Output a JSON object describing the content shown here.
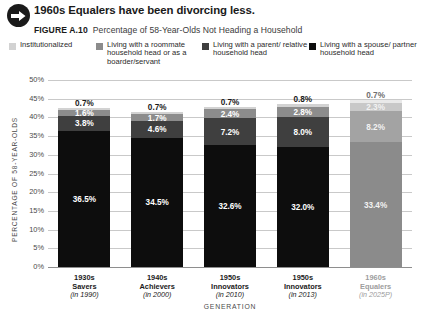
{
  "header": {
    "icon": "arrow-right-circle-icon",
    "title": "1960s Equalers have been divorcing less.",
    "figure_number": "FIGURE A.10",
    "figure_description": "Percentage of 58-Year-Olds Not Heading a Household"
  },
  "legend": {
    "items": [
      {
        "label": "Institutionalized",
        "color": "#d2d2d2"
      },
      {
        "label": "Living with a roommate household head or as a boarder/servant",
        "color": "#8c8c8c"
      },
      {
        "label": "Living with a parent/ relative household head",
        "color": "#3f3f3f"
      },
      {
        "label": "Living with a spouse/ partner household head",
        "color": "#0d0d0d"
      }
    ]
  },
  "chart_data": {
    "type": "bar",
    "stacked": true,
    "title": "Percentage of 58-Year-Olds Not Heading a Household",
    "xlabel": "GENERATION",
    "ylabel": "PERCENTAGE OF 58-YEAR-OLDS",
    "ylim": [
      0,
      50
    ],
    "ytick_labels": [
      "50%",
      "45%",
      "40%",
      "35%",
      "30%",
      "25%",
      "20%",
      "15%",
      "10%",
      "5%",
      "0%"
    ],
    "ytick_values": [
      50,
      45,
      40,
      35,
      30,
      25,
      20,
      15,
      10,
      5,
      0
    ],
    "grid": true,
    "legend_position": "top",
    "categories": [
      {
        "generation": "1930s",
        "cohort": "Savers",
        "year": "(in 1990)",
        "projected": false
      },
      {
        "generation": "1940s",
        "cohort": "Achievers",
        "year": "(in 2000)",
        "projected": false
      },
      {
        "generation": "1950s",
        "cohort": "Innovators",
        "year": "(in 2010)",
        "projected": false
      },
      {
        "generation": "1950s",
        "cohort": "Innovators",
        "year": "(in 2013)",
        "projected": false
      },
      {
        "generation": "1960s",
        "cohort": "Equalers",
        "year": "(in 2025P)",
        "projected": true
      }
    ],
    "series": [
      {
        "name": "Living with a spouse/ partner household head",
        "color": "#0d0d0d",
        "values": [
          36.5,
          34.5,
          32.6,
          32.0,
          33.4
        ],
        "labels": [
          "36.5%",
          "34.5%",
          "32.6%",
          "32.0%",
          "33.4%"
        ]
      },
      {
        "name": "Living with a parent/ relative household head",
        "color": "#3f3f3f",
        "values": [
          3.8,
          4.6,
          7.2,
          8.0,
          8.2
        ],
        "labels": [
          "3.8%",
          "4.6%",
          "7.2%",
          "8.0%",
          "8.2%"
        ]
      },
      {
        "name": "Living with a roommate household head or as a boarder/servant",
        "color": "#8c8c8c",
        "values": [
          1.6,
          1.7,
          2.4,
          2.8,
          2.3
        ],
        "labels": [
          "1.6%",
          "1.7%",
          "2.4%",
          "2.8%",
          "2.3%"
        ]
      },
      {
        "name": "Institutionalized",
        "color": "#d2d2d2",
        "values": [
          0.7,
          0.7,
          0.7,
          0.8,
          0.7
        ],
        "labels": [
          "0.7%",
          "0.7%",
          "0.7%",
          "0.8%",
          "0.7%"
        ]
      }
    ]
  }
}
